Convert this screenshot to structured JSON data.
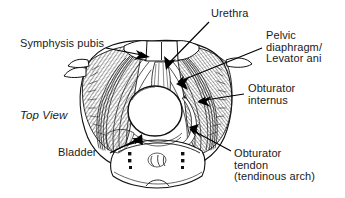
{
  "figure": {
    "title_note": "Top View",
    "view_label": "Top View",
    "ink_color": "#1a1a1a",
    "background_color": "#ffffff",
    "hiatus_fill": "#ffffff"
  },
  "labels": [
    {
      "id": "urethra",
      "text": "Urethra",
      "lines": [
        "Urethra"
      ],
      "x": 211,
      "y": 8,
      "align": "left",
      "leader": {
        "x1": 209,
        "y1": 22,
        "x2": 168,
        "y2": 64,
        "arrow": false
      }
    },
    {
      "id": "symphysis-pubis",
      "text": "Symphysis pubis",
      "lines": [
        "Symphysis pubis"
      ],
      "x": 20,
      "y": 38,
      "align": "left",
      "leader": {
        "x1": 106,
        "y1": 48,
        "x2": 147,
        "y2": 56,
        "arrow": true
      }
    },
    {
      "id": "pelvic-diaphragm",
      "text": "Pelvic diaphragm/ Levator ani",
      "lines": [
        "Pelvic",
        "diaphragm/",
        "Levator ani"
      ],
      "x": 266,
      "y": 30,
      "align": "left",
      "leader": {
        "x1": 262,
        "y1": 48,
        "x2": 178,
        "y2": 82,
        "arrow": true
      }
    },
    {
      "id": "obturator-internus",
      "text": "Obturator internus",
      "lines": [
        "Obturator",
        "internus"
      ],
      "x": 248,
      "y": 83,
      "align": "left",
      "leader": {
        "x1": 244,
        "y1": 94,
        "x2": 199,
        "y2": 101,
        "arrow": true
      }
    },
    {
      "id": "obturator-tendon",
      "text": "Obturator tendon (tendinous arch)",
      "lines": [
        "Obturator",
        "tendon",
        "(tendinous arch)"
      ],
      "x": 234,
      "y": 148,
      "align": "left",
      "leader": {
        "x1": 231,
        "y1": 151,
        "x2": 190,
        "y2": 129,
        "arrow": true
      }
    },
    {
      "id": "bladder",
      "text": "Bladder",
      "lines": [
        "Bladder"
      ],
      "x": 58,
      "y": 147,
      "align": "left",
      "leader": {
        "x1": 110,
        "y1": 153,
        "x2": 140,
        "y2": 138,
        "arrow": true
      }
    },
    {
      "id": "top-view",
      "text": "Top View",
      "lines": [
        "Top View"
      ],
      "x": 20,
      "y": 110,
      "align": "left",
      "italic": true,
      "leader": null
    }
  ]
}
